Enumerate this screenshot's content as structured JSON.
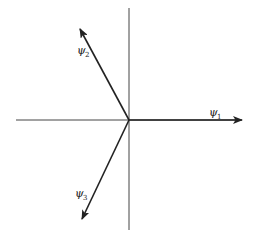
{
  "diagram": {
    "type": "vector-diagram",
    "origin": {
      "x": 129,
      "y": 120
    },
    "axes": {
      "horizontal": {
        "x1": 16,
        "x2": 240,
        "y": 120
      },
      "vertical": {
        "x": 129,
        "y1": 8,
        "y2": 230
      }
    },
    "vectors": [
      {
        "name": "psi1",
        "symbol": "ψ",
        "subscript": "1",
        "tip": {
          "x": 242,
          "y": 120
        },
        "label_pos": {
          "x": 210,
          "y": 114
        }
      },
      {
        "name": "psi2",
        "symbol": "ψ",
        "subscript": "2",
        "tip": {
          "x": 80,
          "y": 29
        },
        "label_pos": {
          "x": 78,
          "y": 54
        }
      },
      {
        "name": "psi3",
        "symbol": "ψ",
        "subscript": "3",
        "tip": {
          "x": 82,
          "y": 219
        },
        "label_pos": {
          "x": 76,
          "y": 197
        }
      }
    ],
    "colors": {
      "axis": "#444444",
      "vector": "#222222",
      "background": "#ffffff"
    }
  }
}
